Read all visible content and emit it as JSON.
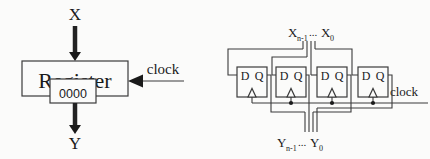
{
  "figure": {
    "description_left": "register block diagram",
    "description_right": "flip-flop array implementation"
  },
  "left_diagram": {
    "input_label": "X",
    "output_label": "Y",
    "register_label": "Register",
    "register_value": "0000",
    "clock_label": "clock"
  },
  "right_diagram": {
    "top_bus_label": {
      "var1": "X",
      "sub1": "n-1",
      "dots": "...",
      "var2": "X",
      "sub2": "0"
    },
    "bottom_bus_label": {
      "var1": "Y",
      "sub1": "n-1",
      "dots": "...",
      "var2": "Y",
      "sub2": "0"
    },
    "clock_label": "clock",
    "flip_flops": [
      {
        "d_label": "D",
        "q_label": "Q"
      },
      {
        "d_label": "D",
        "q_label": "Q"
      },
      {
        "d_label": "D",
        "q_label": "Q"
      },
      {
        "d_label": "D",
        "q_label": "Q"
      }
    ]
  },
  "colors": {
    "wire": "#3b3b3b",
    "text": "#1a1a1a",
    "background": "#fbfbfa"
  }
}
